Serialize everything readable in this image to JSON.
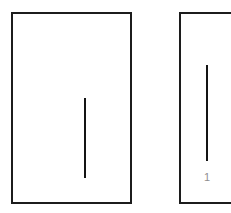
{
  "figure": {
    "background_color": "#ffffff",
    "stroke_color": "#1c1c1c",
    "line_color": "#141414",
    "label_color": "#8f8f8f",
    "width_px": 231,
    "height_px": 213,
    "title": "",
    "caption": ""
  },
  "panels": [
    {
      "id": "panel-left",
      "name": "left-panel",
      "border_color": "#1c1c1c",
      "border_width_px": 2,
      "x": 11,
      "y": 12,
      "width": 121,
      "height": 192,
      "clipped": false,
      "label": "",
      "line": {
        "name": "left-vertical-line",
        "orientation": "vertical",
        "x": 71,
        "y_top": 84,
        "y_bottom": 164,
        "length_px": 80,
        "thickness_px": 2,
        "color": "#141414"
      }
    },
    {
      "id": "panel-right",
      "name": "right-panel",
      "border_color": "#1c1c1c",
      "border_width_px": 2,
      "x": 179,
      "y": 12,
      "width": 68,
      "height": 192,
      "clipped": true,
      "label": "1",
      "line": {
        "name": "right-vertical-line",
        "orientation": "vertical",
        "x": 206,
        "y_top": 65,
        "y_bottom": 161,
        "length_px": 96,
        "thickness_px": 2,
        "color": "#141414"
      }
    }
  ],
  "labels": {
    "right_panel_label": "1"
  }
}
